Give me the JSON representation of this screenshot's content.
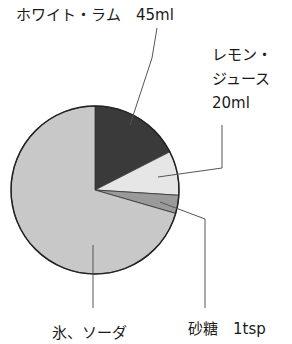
{
  "chart_data": {
    "type": "pie",
    "title": "",
    "start": "top",
    "direction": "clockwise",
    "slices": [
      {
        "name": "ホワイト・ラム",
        "amount": "45ml",
        "share": 17.5,
        "color": "#3a3a3a"
      },
      {
        "name": "レモン・ジュース",
        "amount": "20ml",
        "share": 8.5,
        "color": "#e6e6e6"
      },
      {
        "name": "砂糖",
        "amount": "1tsp",
        "share": 3.5,
        "color": "#9a9a9a"
      },
      {
        "name": "氷、ソーダ",
        "amount": "",
        "share": 70.5,
        "color": "#c8c8c8"
      }
    ],
    "labels": {
      "rum": "ホワイト・ラム　45ml",
      "lemon_line1": "レモン・",
      "lemon_line2": "ジュース",
      "lemon_line3": "20ml",
      "sugar": "砂糖　1tsp",
      "ice": "氷、ソーダ"
    }
  }
}
